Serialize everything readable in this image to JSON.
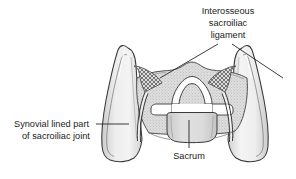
{
  "figure": {
    "background_color": "#ffffff",
    "line_color": "#3a3a3a",
    "bone_fill": "#e9e9e9",
    "bone_fill_dark": "#cfcfcf",
    "ligament_hatch_color": "#5a5a5a",
    "canal_fill": "#ffffff",
    "text_color": "#1b1b1b"
  },
  "labels": {
    "interosseous_ligament": {
      "name": "Interosseous sacroiliac ligament",
      "lines": [
        "Interosseous",
        "sacroiliac",
        "ligament"
      ],
      "align": "center",
      "x": 228,
      "y1": 14,
      "y2": 26,
      "y3": 38
    },
    "synovial_joint": {
      "name": "Synovial lined part of sacroiliac joint",
      "lines": [
        "Synovial lined part",
        "of sacroiliac joint"
      ],
      "align": "left",
      "x": 14,
      "y1": 124,
      "y2": 136
    },
    "sacrum": {
      "name": "Sacrum",
      "lines": [
        "Sacrum"
      ],
      "align": "center",
      "x": 189,
      "y1": 156
    }
  },
  "leader_lines": {
    "ligament_left": {
      "name": "leader-line-ligament-left",
      "from_x": 218,
      "from_y": 44,
      "to_x": 160,
      "to_y": 78
    },
    "ligament_right": {
      "name": "leader-line-ligament-right",
      "from_x": 232,
      "from_y": 44,
      "to_x": 283,
      "to_y": 78
    },
    "synovial": {
      "name": "leader-line-synovial-joint",
      "from_x": 96,
      "from_y": 124,
      "to_x": 129,
      "to_y": 124
    },
    "sacrum": {
      "name": "leader-line-sacrum",
      "from_x": 189,
      "from_y": 120,
      "to_x": 189,
      "to_y": 148
    }
  },
  "anatomy": {
    "left_ilium": {
      "name": "left-iliac-wing"
    },
    "right_ilium": {
      "name": "right-iliac-wing"
    },
    "sacrum_body": {
      "name": "sacral-vertebral-body"
    },
    "spinal_canal": {
      "name": "sacral-canal"
    },
    "left_ligament": {
      "name": "left-interosseous-ligament-hatch"
    },
    "right_ligament": {
      "name": "right-interosseous-ligament-hatch"
    },
    "left_joint_line": {
      "name": "left-synovial-joint-line"
    },
    "right_joint_line": {
      "name": "right-synovial-joint-line"
    }
  }
}
